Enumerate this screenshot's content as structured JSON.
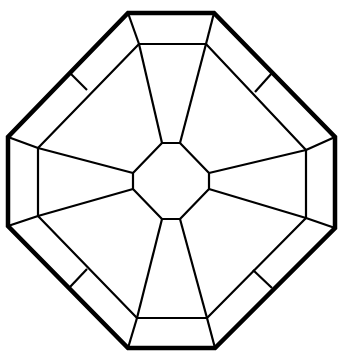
{
  "diagram": {
    "title": "",
    "colors": {
      "background": "#ffffff",
      "stroke": "#000000"
    },
    "outer_octagon": [
      [
        128,
        13
      ],
      [
        214,
        13
      ],
      [
        335,
        137
      ],
      [
        335,
        228
      ],
      [
        215,
        348
      ],
      [
        128,
        348
      ],
      [
        8,
        226
      ],
      [
        8,
        137
      ]
    ],
    "inner_ring": [
      [
        139,
        44
      ],
      [
        206,
        44
      ],
      [
        306,
        150
      ],
      [
        306,
        218
      ],
      [
        207,
        318
      ],
      [
        137,
        318
      ],
      [
        38,
        216
      ],
      [
        38,
        148
      ]
    ],
    "center_octagon": [
      [
        162,
        143
      ],
      [
        180,
        143
      ],
      [
        209,
        173
      ],
      [
        209,
        189
      ],
      [
        180,
        219
      ],
      [
        162,
        219
      ],
      [
        133,
        189
      ],
      [
        133,
        173
      ]
    ],
    "ticks": [
      [
        [
          70,
          73
        ],
        [
          87,
          90
        ]
      ],
      [
        [
          272,
          73
        ],
        [
          255,
          92
        ]
      ],
      [
        [
          70,
          287
        ],
        [
          87,
          269
        ]
      ],
      [
        [
          272,
          288
        ],
        [
          253,
          270
        ]
      ]
    ]
  }
}
